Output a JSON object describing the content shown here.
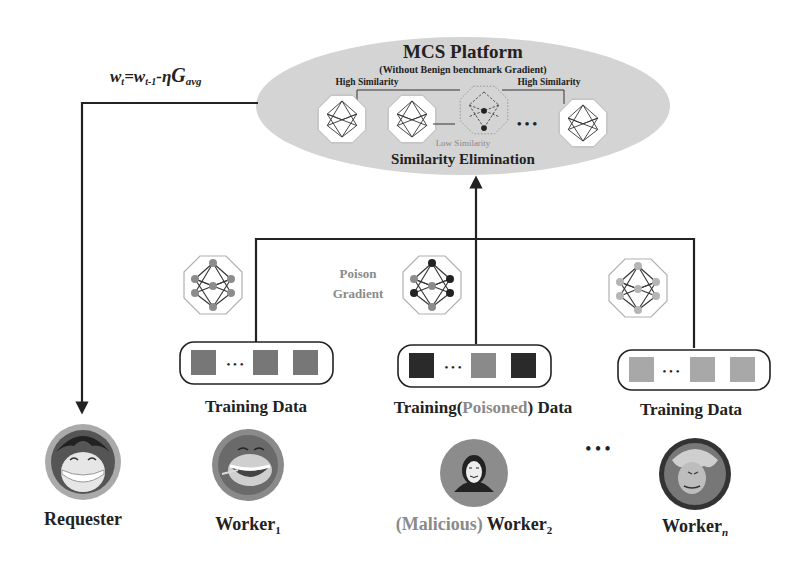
{
  "platform": {
    "title": "MCS Platform",
    "subtitle": "(Without Benign benchmark Gradient)",
    "high_similarity_left": "High Similarity",
    "high_similarity_right": "High Similarity",
    "low_similarity": "Low Similarity",
    "footer": "Similarity Elimination",
    "ellipsis": "• • •"
  },
  "update_rule": {
    "w": "w",
    "t": "t",
    "eq": "=",
    "w2": "w",
    "t1": "t-1",
    "minus_eta": "-η",
    "G": "G",
    "avg": "avg"
  },
  "poison_label": {
    "line1": "Poison",
    "line2": "Gradient"
  },
  "data_boxes": [
    {
      "label": "Training Data",
      "colors": [
        "#777777",
        "#777777",
        "#777777"
      ],
      "dots": "• • •"
    },
    {
      "label_pre": "Training(",
      "label_mid": "Poisoned",
      "label_post": ") Data",
      "colors": [
        "#2a2a2a",
        "#8a8a8a",
        "#2a2a2a"
      ],
      "dots": "• • •"
    },
    {
      "label": "Training Data",
      "colors": [
        "#a8a8a8",
        "#a8a8a8",
        "#a8a8a8"
      ],
      "dots": "• • •"
    }
  ],
  "actors": [
    {
      "name": "Requester",
      "icon": "requester-avatar"
    },
    {
      "name": "Worker",
      "sub": "1",
      "icon": "worker-avatar"
    },
    {
      "prefix": "(Malicious)",
      "name": " Worker",
      "sub": "2",
      "icon": "hacker-avatar"
    },
    {
      "name": "Worker",
      "sub": "n",
      "icon": "worker-avatar"
    }
  ],
  "workers_ellipsis": "• • •",
  "colors": {
    "ellipse_fill": "#d4d4d4",
    "line": "#222222",
    "octagon_border": "#b0b0b0",
    "node_gray": "#8c8c8c",
    "node_dark": "#2a2a2a",
    "node_light": "#b5b5b5",
    "poisoned_text": "#8a8a8a"
  }
}
